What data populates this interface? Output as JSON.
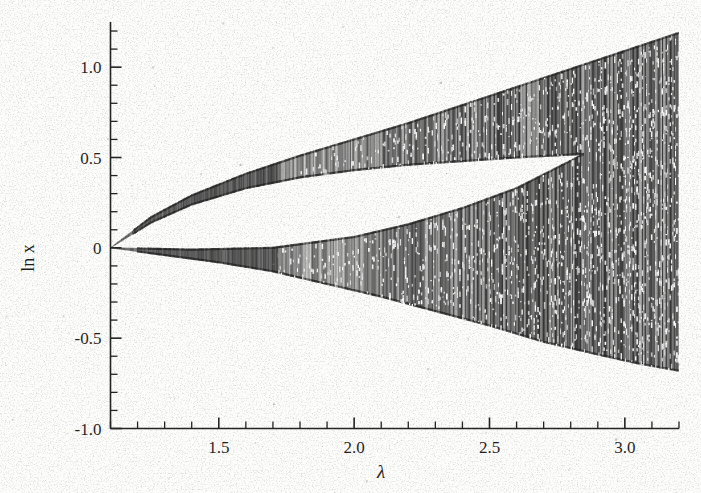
{
  "figure": {
    "kind": "bifurcation-diagram",
    "background_color": "#fdfdfc",
    "ink_color": "#232323"
  },
  "axes": {
    "x_title": "λ",
    "y_title": "ln x",
    "x_tick_labels": [
      "1.5",
      "2.0",
      "2.5",
      "3.0"
    ],
    "y_tick_labels": [
      "1.0",
      "0.5",
      "0",
      "-0.5",
      "-1.0"
    ]
  },
  "chart_data": {
    "type": "scatter",
    "title": "",
    "subtitle": "",
    "xlabel": "λ",
    "ylabel": "ln x",
    "xlim": [
      1.1,
      3.2
    ],
    "ylim": [
      -1.0,
      1.25
    ],
    "x_ticks": [
      1.5,
      2.0,
      2.5,
      3.0
    ],
    "x_tick_labels": [
      "1.5",
      "2.0",
      "2.5",
      "3.0"
    ],
    "x_minor_tick_step": 0.1,
    "y_ticks": [
      1.0,
      0.5,
      0.0,
      -0.5,
      -1.0
    ],
    "y_tick_labels": [
      "1.0",
      "0.5",
      "0",
      "-0.5",
      "-1.0"
    ],
    "y_minor_tick_step": 0.1,
    "grid": false,
    "legend": "none",
    "bifurcation_point": {
      "lambda": 1.1,
      "ln_x": 0.0
    },
    "band_merge_point": {
      "lambda": 2.85,
      "ln_x": 0.52
    },
    "envelope": {
      "upper_band_top": [
        {
          "lambda": 1.1,
          "ln_x": 0.0
        },
        {
          "lambda": 1.25,
          "ln_x": 0.17
        },
        {
          "lambda": 1.4,
          "ln_x": 0.29
        },
        {
          "lambda": 1.6,
          "ln_x": 0.41
        },
        {
          "lambda": 1.8,
          "ln_x": 0.51
        },
        {
          "lambda": 2.0,
          "ln_x": 0.6
        },
        {
          "lambda": 2.2,
          "ln_x": 0.69
        },
        {
          "lambda": 2.4,
          "ln_x": 0.79
        },
        {
          "lambda": 2.6,
          "ln_x": 0.89
        },
        {
          "lambda": 2.8,
          "ln_x": 0.99
        },
        {
          "lambda": 3.0,
          "ln_x": 1.09
        },
        {
          "lambda": 3.2,
          "ln_x": 1.19
        }
      ],
      "upper_band_bottom": [
        {
          "lambda": 1.1,
          "ln_x": 0.0
        },
        {
          "lambda": 1.25,
          "ln_x": 0.14
        },
        {
          "lambda": 1.4,
          "ln_x": 0.24
        },
        {
          "lambda": 1.6,
          "ln_x": 0.33
        },
        {
          "lambda": 1.8,
          "ln_x": 0.39
        },
        {
          "lambda": 2.0,
          "ln_x": 0.43
        },
        {
          "lambda": 2.2,
          "ln_x": 0.46
        },
        {
          "lambda": 2.4,
          "ln_x": 0.48
        },
        {
          "lambda": 2.6,
          "ln_x": 0.5
        },
        {
          "lambda": 2.85,
          "ln_x": 0.52
        }
      ],
      "lower_band_top": [
        {
          "lambda": 1.1,
          "ln_x": 0.0
        },
        {
          "lambda": 1.4,
          "ln_x": -0.01
        },
        {
          "lambda": 1.7,
          "ln_x": 0.0
        },
        {
          "lambda": 2.0,
          "ln_x": 0.06
        },
        {
          "lambda": 2.2,
          "ln_x": 0.13
        },
        {
          "lambda": 2.4,
          "ln_x": 0.22
        },
        {
          "lambda": 2.6,
          "ln_x": 0.33
        },
        {
          "lambda": 2.85,
          "ln_x": 0.52
        },
        {
          "lambda": 3.0,
          "ln_x": 0.95
        },
        {
          "lambda": 3.2,
          "ln_x": 1.19
        }
      ],
      "lower_band_bottom": [
        {
          "lambda": 1.1,
          "ln_x": 0.0
        },
        {
          "lambda": 1.3,
          "ln_x": -0.04
        },
        {
          "lambda": 1.5,
          "ln_x": -0.08
        },
        {
          "lambda": 1.7,
          "ln_x": -0.13
        },
        {
          "lambda": 1.9,
          "ln_x": -0.2
        },
        {
          "lambda": 2.1,
          "ln_x": -0.27
        },
        {
          "lambda": 2.3,
          "ln_x": -0.35
        },
        {
          "lambda": 2.5,
          "ln_x": -0.43
        },
        {
          "lambda": 2.7,
          "ln_x": -0.52
        },
        {
          "lambda": 2.9,
          "ln_x": -0.59
        },
        {
          "lambda": 3.05,
          "ln_x": -0.64
        },
        {
          "lambda": 3.2,
          "ln_x": -0.68
        }
      ]
    }
  }
}
